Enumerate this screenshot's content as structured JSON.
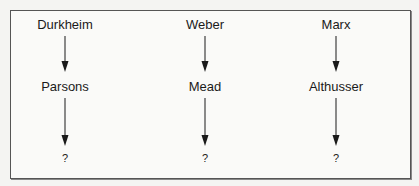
{
  "diagram": {
    "type": "lineage-flow",
    "columns": [
      {
        "top": "Durkheim",
        "middle": "Parsons",
        "bottom": "?"
      },
      {
        "top": "Weber",
        "middle": "Mead",
        "bottom": "?"
      },
      {
        "top": "Marx",
        "middle": "Althusser",
        "bottom": "?"
      }
    ],
    "edges": [
      {
        "from": "Durkheim",
        "to": "Parsons"
      },
      {
        "from": "Parsons",
        "to": "?"
      },
      {
        "from": "Weber",
        "to": "Mead"
      },
      {
        "from": "Mead",
        "to": "?"
      },
      {
        "from": "Marx",
        "to": "Althusser"
      },
      {
        "from": "Althusser",
        "to": "?"
      }
    ],
    "colors": {
      "border": "#555555",
      "arrow": "#1a1a1a",
      "text": "#1a1a1a"
    }
  }
}
